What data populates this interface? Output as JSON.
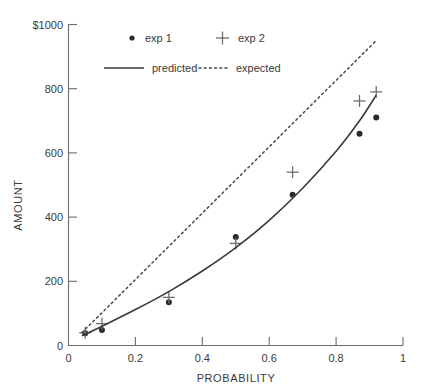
{
  "chart_data": {
    "type": "scatter",
    "title": "",
    "xlabel": "PROBABILITY",
    "ylabel": "AMOUNT",
    "xlim": [
      0,
      1
    ],
    "ylim": [
      0,
      1000
    ],
    "grid": false,
    "legend_position": "top-center",
    "x_ticks": [
      "0",
      "0.2",
      "0.4",
      "0.6",
      "0.8",
      "1"
    ],
    "x_tick_values": [
      0,
      0.2,
      0.4,
      0.6,
      0.8,
      1
    ],
    "y_ticks": [
      "0",
      "200",
      "400",
      "600",
      "800",
      "$1000"
    ],
    "y_tick_values": [
      0,
      200,
      400,
      600,
      800,
      1000
    ],
    "series": [
      {
        "name": "exp 1",
        "marker": "dot",
        "type": "scatter",
        "x": [
          0.05,
          0.1,
          0.3,
          0.5,
          0.67,
          0.87,
          0.92
        ],
        "y": [
          38,
          48,
          135,
          338,
          470,
          660,
          710
        ]
      },
      {
        "name": "exp 2",
        "marker": "plus",
        "type": "scatter",
        "x": [
          0.05,
          0.1,
          0.3,
          0.5,
          0.67,
          0.87,
          0.92
        ],
        "y": [
          40,
          68,
          150,
          318,
          540,
          762,
          790
        ]
      },
      {
        "name": "predicted",
        "marker": "solid-line",
        "type": "line",
        "x": [
          0.04,
          0.1,
          0.2,
          0.3,
          0.4,
          0.5,
          0.6,
          0.7,
          0.8,
          0.87,
          0.92
        ],
        "y": [
          30,
          60,
          112,
          168,
          232,
          305,
          390,
          490,
          605,
          700,
          780
        ]
      },
      {
        "name": "expected",
        "marker": "dotted-line",
        "type": "line",
        "x": [
          0.04,
          0.92
        ],
        "y": [
          40,
          950
        ]
      }
    ]
  },
  "legend": {
    "items": [
      {
        "label": "exp 1",
        "marker": "dot"
      },
      {
        "label": "exp 2",
        "marker": "plus"
      },
      {
        "label": "predicted",
        "marker": "solid-line"
      },
      {
        "label": "expected",
        "marker": "dotted-line"
      }
    ]
  },
  "axes": {
    "x_title": "PROBABILITY",
    "y_title": "AMOUNT",
    "x_tick_labels": [
      "0",
      "0.2",
      "0.4",
      "0.6",
      "0.8",
      "1"
    ],
    "y_tick_labels": [
      "0",
      "200",
      "400",
      "600",
      "800",
      "$1000"
    ]
  },
  "colors": {
    "axis": "#6b6b6b",
    "predicted": "#3a3a3a",
    "expected": "#4a4a4a",
    "exp1_marker": "#2b2b2b",
    "exp2_marker": "#6f6f6f",
    "text": "#3a3a3a",
    "background": "#ffffff"
  }
}
